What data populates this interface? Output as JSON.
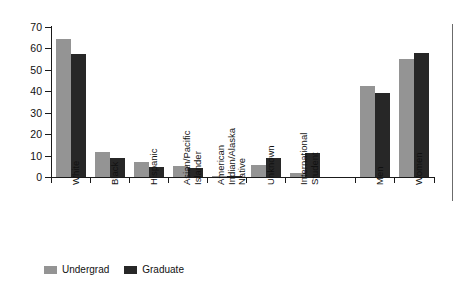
{
  "chart_data": {
    "type": "bar",
    "title": "",
    "subtitle": "",
    "xlabel": "",
    "ylabel": "",
    "ylim": [
      0,
      70
    ],
    "yticks": [
      0,
      10,
      20,
      30,
      40,
      50,
      60,
      70
    ],
    "grid": false,
    "legend_position": "bottom-left",
    "categories": [
      "White",
      "Black",
      "Hispanic",
      "Asian/Pacific Islander",
      "American Indian/Alaska Native",
      "Unknown",
      "International Student",
      "Men",
      "Women"
    ],
    "category_lines": [
      [
        "White"
      ],
      [
        "Black"
      ],
      [
        "Hispanic"
      ],
      [
        "Asian/Pacific",
        "Islander"
      ],
      [
        "American",
        "Indian/Alaska",
        "Native"
      ],
      [
        "Unknown"
      ],
      [
        "International",
        "Student"
      ],
      [
        "Men"
      ],
      [
        "Women"
      ]
    ],
    "series": [
      {
        "name": "Undergrad",
        "color": "#949494",
        "values": [
          64.5,
          11.5,
          7.0,
          5.0,
          0.4,
          5.5,
          1.7,
          42.5,
          55.0
        ]
      },
      {
        "name": "Graduate",
        "color": "#272727",
        "values": [
          57.5,
          9.0,
          4.5,
          4.0,
          0.3,
          8.7,
          11.3,
          39.0,
          58.0
        ]
      }
    ]
  },
  "legend": {
    "items": [
      {
        "label": "Undergrad",
        "color": "#949494"
      },
      {
        "label": "Graduate",
        "color": "#272727"
      }
    ]
  },
  "axis": {
    "y_tick_labels": [
      "0",
      "10",
      "20",
      "30",
      "40",
      "50",
      "60",
      "70"
    ]
  }
}
